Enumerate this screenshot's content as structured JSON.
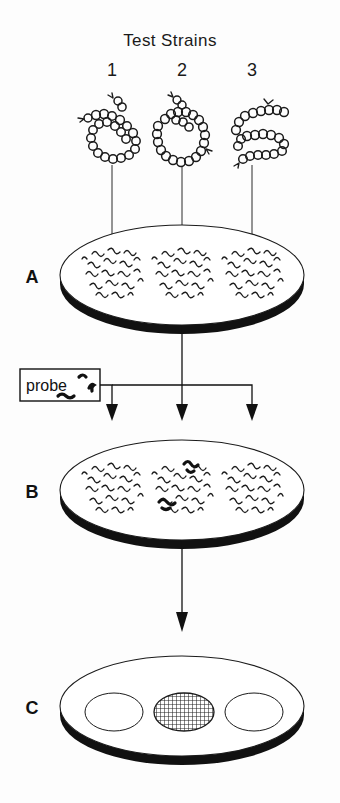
{
  "figure": {
    "title": "Test Strains",
    "type": "colony-hybridization-diagram",
    "columns": [
      {
        "number": "1",
        "genome_icon": "supercoiled-plasmid-circle",
        "result": "negative"
      },
      {
        "number": "2",
        "genome_icon": "relaxed-plasmid-circle",
        "result": "positive"
      },
      {
        "number": "3",
        "genome_icon": "linear-dna-strand",
        "result": "negative"
      }
    ]
  },
  "panels": [
    {
      "label": "A",
      "caption_icon": "petri-dish",
      "colony_count": 3,
      "colony_state": "unhybridized-colonies",
      "colonies": [
        {
          "strain": "1",
          "probe_bound": 0
        },
        {
          "strain": "2",
          "probe_bound": 0
        },
        {
          "strain": "3",
          "probe_bound": 0
        }
      ]
    },
    {
      "label": "B",
      "caption_icon": "petri-dish",
      "colony_count": 3,
      "colony_state": "probe-applied",
      "colonies": [
        {
          "strain": "1",
          "probe_bound": 0
        },
        {
          "strain": "2",
          "probe_bound": 2
        },
        {
          "strain": "3",
          "probe_bound": 0
        }
      ]
    },
    {
      "label": "C",
      "caption_icon": "petri-dish",
      "colony_count": 3,
      "colony_state": "autoradiograph-result",
      "colonies": [
        {
          "strain": "1",
          "signal": "blank"
        },
        {
          "strain": "2",
          "signal": "hatched"
        },
        {
          "strain": "3",
          "signal": "blank"
        }
      ]
    }
  ],
  "probe": {
    "box_label": "probe",
    "marks": 3
  },
  "colors": {
    "ink": "#111111",
    "line": "#1b1b1b",
    "paper": "#ffffff",
    "hatch": "#222222"
  },
  "geometry": {
    "columns_x": [
      112,
      182,
      252
    ],
    "dish_cx": 182,
    "dish_rx": 122,
    "dish_ry": 50
  }
}
